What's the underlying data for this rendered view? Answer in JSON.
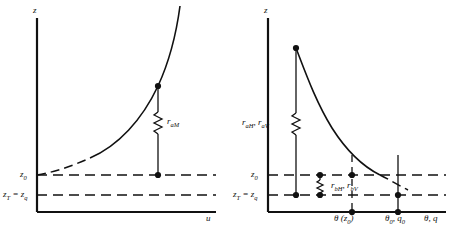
{
  "figure": {
    "type": "diagram"
  },
  "panels": [
    {
      "id": "left",
      "y_axis_label": "z",
      "x_axis_label": "u",
      "profile": {
        "name": "wind-speed-profile",
        "shape": "logarithmic increasing with height",
        "dashed_lower_portion": true
      },
      "height_levels": [
        {
          "name": "z0",
          "label_html": "z<sub>0</sub>",
          "plain": "z0"
        },
        {
          "name": "zT-zq",
          "label_html": "z<sub>T</sub> = z<sub>q</sub>",
          "plain": "zT = zq"
        }
      ],
      "resistances": [
        {
          "name": "r-aM",
          "label_html": "r<sub>aM</sub>",
          "plain": "raM"
        }
      ],
      "markers": [
        "upper-profile-point",
        "z0-level-point"
      ]
    },
    {
      "id": "right",
      "y_axis_label": "z",
      "x_axis_label": "θ, q",
      "profile": {
        "name": "temperature-humidity-profile",
        "shape": "decreasing with height, logarithmic",
        "dashed_lower_portion": true
      },
      "height_levels": [
        {
          "name": "z0",
          "label_html": "z<sub>0</sub>",
          "plain": "z0"
        },
        {
          "name": "zT-zq",
          "label_html": "z<sub>T</sub> = z<sub>q</sub>",
          "plain": "zT = zq"
        }
      ],
      "resistances": [
        {
          "name": "r-aH-r-aV",
          "label_html": "r<sub>aH</sub>, r<sub>aV</sub>",
          "plain": "raH, raV"
        },
        {
          "name": "r-bH-r-bV",
          "label_html": "r<sub>bH</sub>, r<sub>bV</sub>",
          "plain": "rbH, rbV"
        }
      ],
      "x_ticks": [
        {
          "name": "theta-z0",
          "label_html": "θ (z<sub>0</sub>)",
          "plain": "theta(z0)"
        },
        {
          "name": "theta0-q0",
          "label_html": "θ<sub>0</sub>, q<sub>0</sub>",
          "plain": "theta0, q0"
        }
      ],
      "markers": [
        "upper-profile-point",
        "z0-intersection-point",
        "surface-intersection-point"
      ]
    }
  ],
  "colors": {
    "ink": "#111111",
    "background": "#ffffff"
  }
}
